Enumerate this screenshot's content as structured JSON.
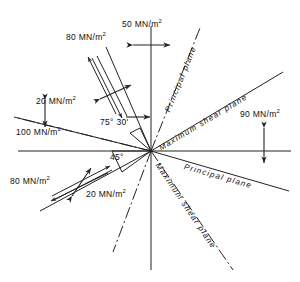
{
  "figure": {
    "type": "stress-element-plane-diagram",
    "center": {
      "x": 151,
      "y": 151
    },
    "angles": [
      {
        "name": "principal-plane-angle",
        "text": "75° 30'",
        "value_deg": 75.5
      },
      {
        "name": "maximum-shear-plane-angle",
        "text": "45°",
        "value_deg": 45
      }
    ],
    "stress_labels": [
      {
        "name": "top-normal-stress",
        "value": "50",
        "unit": "MN/m",
        "exp": "2",
        "text": "50 MN/m²"
      },
      {
        "name": "upper-left-shear-stress",
        "value": "80",
        "unit": "MN/m",
        "exp": "2",
        "text": "80 MN/m²"
      },
      {
        "name": "upper-left-normal-stress",
        "value": "20",
        "unit": "MN/m",
        "exp": "2",
        "text": "20 MN/m²"
      },
      {
        "name": "left-normal-stress",
        "value": "100",
        "unit": "MN/m",
        "exp": "2",
        "text": "100 MN/m²"
      },
      {
        "name": "right-normal-stress",
        "value": "90",
        "unit": "MN/m",
        "exp": "2",
        "text": "90 MN/m²"
      },
      {
        "name": "lower-left-shear-stress",
        "value": "80",
        "unit": "MN/m",
        "exp": "2",
        "text": "80 MN/m²"
      },
      {
        "name": "lower-left-normal-stress",
        "value": "20",
        "unit": "MN/m",
        "exp": "2",
        "text": "20 MN/m²"
      }
    ],
    "plane_labels": [
      {
        "name": "principal-plane-upper",
        "text": "Principal   plane"
      },
      {
        "name": "maximum-shear-plane-upper",
        "text": "Maximum   shear   plane"
      },
      {
        "name": "principal-plane-lower",
        "text": "Principal   plane"
      },
      {
        "name": "maximum-shear-plane-lower",
        "text": "Maximum   shear   plane"
      }
    ],
    "colors": {
      "line": "#222222",
      "text": "#111111",
      "background": "#ffffff"
    }
  }
}
